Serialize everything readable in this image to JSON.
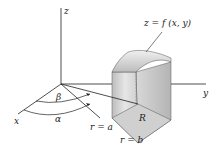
{
  "diagram": {
    "axes": {
      "x": "x",
      "y": "y",
      "z": "z"
    },
    "surface_label": "z = f (x, y)",
    "angle_labels": {
      "alpha": "α",
      "beta": "β"
    },
    "region_label": "R",
    "radius_labels": {
      "inner": "r = a",
      "outer": "r = b"
    },
    "colors": {
      "line": "#222222",
      "solid_light": "#e4e4e4",
      "solid_mid": "#c8c8c8",
      "solid_dark": "#a8a8a8"
    }
  }
}
